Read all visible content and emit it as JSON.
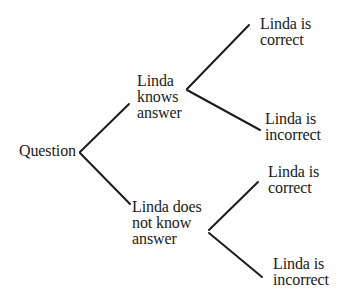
{
  "diagram": {
    "type": "decision-tree",
    "root": {
      "label": "Question",
      "children": [
        {
          "lines": [
            "Linda",
            "knows",
            "answer"
          ],
          "children": [
            {
              "lines": [
                "Linda is",
                "correct"
              ]
            },
            {
              "lines": [
                "Linda is",
                "incorrect"
              ]
            }
          ]
        },
        {
          "lines": [
            "Linda does",
            "not know",
            "answer"
          ],
          "children": [
            {
              "lines": [
                "Linda is",
                "correct"
              ]
            },
            {
              "lines": [
                "Linda is",
                "incorrect"
              ]
            }
          ]
        }
      ]
    },
    "edges": [
      {
        "from": "Question",
        "to": "Linda knows answer",
        "x1": 80,
        "y1": 152,
        "x2": 129,
        "y2": 104
      },
      {
        "from": "Question",
        "to": "Linda does not know answer",
        "x1": 80,
        "y1": 153,
        "x2": 130,
        "y2": 204
      },
      {
        "from": "Linda knows answer",
        "to": "Linda is correct",
        "x1": 187,
        "y1": 89,
        "x2": 249,
        "y2": 25
      },
      {
        "from": "Linda knows answer",
        "to": "Linda is incorrect",
        "x1": 187,
        "y1": 90,
        "x2": 260,
        "y2": 130
      },
      {
        "from": "Linda does not know answer",
        "to": "Linda is correct",
        "x1": 209,
        "y1": 230,
        "x2": 258,
        "y2": 182
      },
      {
        "from": "Linda does not know answer",
        "to": "Linda is incorrect",
        "x1": 209,
        "y1": 233,
        "x2": 262,
        "y2": 277
      }
    ],
    "line_color": "#1c1c1c",
    "text_color": "#1a1a1a",
    "background": "#ffffff"
  }
}
